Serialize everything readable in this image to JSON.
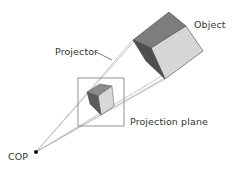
{
  "figure": {
    "colors": {
      "background": "#ffffff",
      "projector_line": "#b8b8b8",
      "plane_border": "#888888",
      "edge": "#444444",
      "face_top": "#7d7d7d",
      "face_side_dark": "#4e4e4e",
      "face_front_light": "#d6d6d6",
      "cop_point": "#111111",
      "text": "#333333"
    },
    "labels": {
      "object": "Object",
      "projector": "Projector",
      "projection_plane": "Projection plane",
      "cop": "COP"
    }
  }
}
